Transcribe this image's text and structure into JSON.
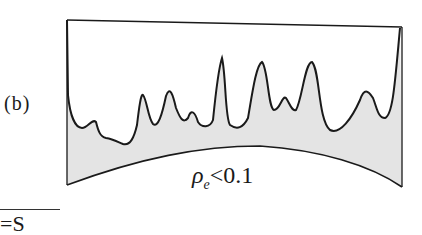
{
  "figure": {
    "panel_label": "(b)",
    "condition_label": {
      "symbol": "ρ",
      "subscript": "e",
      "relation": "<0.1"
    },
    "bottom_text": "=S",
    "colors": {
      "line": "#1a1a1a",
      "fill": "#e4e4e4",
      "background": "#ffffff"
    }
  }
}
